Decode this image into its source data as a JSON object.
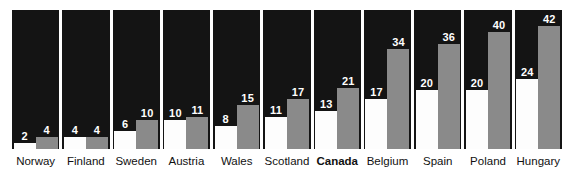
{
  "chart_data": {
    "type": "bar",
    "title": "",
    "subtitle": "",
    "xlabel": "",
    "ylabel": "",
    "ylim": [
      0,
      42
    ],
    "grid": false,
    "legend_position": "none",
    "highlight_category": "Canada",
    "categories": [
      "Norway",
      "Finland",
      "Sweden",
      "Austria",
      "Wales",
      "Scotland",
      "Canada",
      "Belgium",
      "Spain",
      "Poland",
      "Hungary"
    ],
    "series": [
      {
        "name": "white",
        "color": "#fdfdfd",
        "values": [
          2,
          4,
          6,
          10,
          8,
          11,
          13,
          17,
          20,
          20,
          24
        ]
      },
      {
        "name": "gray",
        "color": "#8a8a8a",
        "values": [
          4,
          4,
          10,
          11,
          15,
          17,
          21,
          34,
          36,
          40,
          42
        ]
      }
    ]
  },
  "colors": {
    "panel_background": "#141414",
    "page_background": "#ffffff",
    "white_bar": "#fdfdfd",
    "gray_bar": "#8a8a8a",
    "value_label": "#ffffff",
    "category_label": "#111111"
  }
}
